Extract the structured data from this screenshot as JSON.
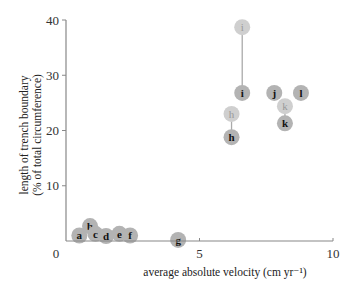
{
  "chart_data": {
    "type": "scatter",
    "title": "",
    "xlabel": "average absolute velocity (cm  yr⁻¹)",
    "ylabel_line1": "length of trench boundary",
    "ylabel_line2": "(% of total circumference)",
    "xlim": [
      0,
      10
    ],
    "ylim": [
      0,
      40
    ],
    "x_ticks": [
      0,
      5,
      10
    ],
    "y_ticks": [
      10,
      20,
      30,
      40
    ],
    "grid": false,
    "legend": null,
    "point_color": "#b3b3b3",
    "ghost_point_color": "#cfcfcf",
    "connector_color": "#aaaaaa",
    "points": [
      {
        "label": "a",
        "x": 0.5,
        "y": 1.0,
        "ghost": false
      },
      {
        "label": "b",
        "x": 0.9,
        "y": 2.7,
        "ghost": false
      },
      {
        "label": "c",
        "x": 1.1,
        "y": 1.3,
        "ghost": false
      },
      {
        "label": "d",
        "x": 1.5,
        "y": 0.9,
        "ghost": false
      },
      {
        "label": "e",
        "x": 2.0,
        "y": 1.3,
        "ghost": false
      },
      {
        "label": "f",
        "x": 2.4,
        "y": 1.0,
        "ghost": false
      },
      {
        "label": "g",
        "x": 4.2,
        "y": 0.2,
        "ghost": false
      },
      {
        "label": "h",
        "x": 6.2,
        "y": 18.8,
        "ghost": false
      },
      {
        "label": "h",
        "x": 6.2,
        "y": 23.0,
        "ghost": true
      },
      {
        "label": "i",
        "x": 6.6,
        "y": 26.8,
        "ghost": false
      },
      {
        "label": "i",
        "x": 6.6,
        "y": 38.7,
        "ghost": true
      },
      {
        "label": "j",
        "x": 7.8,
        "y": 26.8,
        "ghost": false
      },
      {
        "label": "k",
        "x": 8.2,
        "y": 21.3,
        "ghost": false
      },
      {
        "label": "k",
        "x": 8.2,
        "y": 24.4,
        "ghost": true
      },
      {
        "label": "l",
        "x": 8.8,
        "y": 26.8,
        "ghost": false
      }
    ],
    "connectors": [
      {
        "from": "h",
        "x": 6.2,
        "y1": 18.8,
        "y2": 23.0
      },
      {
        "from": "i",
        "x": 6.6,
        "y1": 26.8,
        "y2": 38.7
      },
      {
        "from": "k",
        "x": 8.2,
        "y1": 21.3,
        "y2": 24.4
      }
    ]
  }
}
